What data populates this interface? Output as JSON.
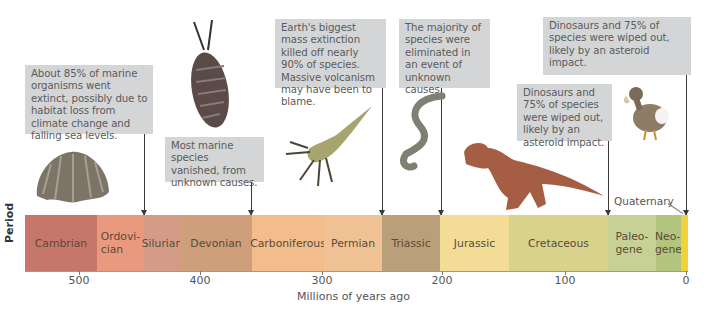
{
  "diagram": {
    "y_axis_label": "Period",
    "x_axis_title": "Millions of years ago",
    "ticks": [
      {
        "label": "500",
        "x": 79
      },
      {
        "label": "400",
        "x": 200
      },
      {
        "label": "300",
        "x": 322
      },
      {
        "label": "200",
        "x": 442
      },
      {
        "label": "100",
        "x": 565
      },
      {
        "label": "0",
        "x": 686
      }
    ],
    "periods": [
      {
        "name": "Cambrian",
        "color": "#c6776a"
      },
      {
        "name": "Ordovi-\ncian",
        "color": "#e99a7e"
      },
      {
        "name": "Silurian",
        "color": "#d49c86"
      },
      {
        "name": "Devonian",
        "color": "#cf9e7a"
      },
      {
        "name": "Carboniferous",
        "color": "#f2bd8b"
      },
      {
        "name": "Permian",
        "color": "#f0c293"
      },
      {
        "name": "Triassic",
        "color": "#b9a07a"
      },
      {
        "name": "Jurassic",
        "color": "#f3dc96"
      },
      {
        "name": "Cretaceous",
        "color": "#d9d28d"
      },
      {
        "name": "Paleo-\ngene",
        "color": "#c7d195"
      },
      {
        "name": "Neo-\ngene",
        "color": "#b3c47c"
      },
      {
        "name": "",
        "color": "#f2d23c"
      }
    ],
    "quaternary_label": "Quaternary",
    "callouts": [
      {
        "id": "end-ordovician",
        "text": "About 85% of marine organisms went extinct, possibly due to habitat loss from climate change and falling sea levels."
      },
      {
        "id": "late-devonian",
        "text": "Most marine species vanished, from unknown causes."
      },
      {
        "id": "end-permian",
        "text": "Earth's biggest mass extinction killed off nearly 90% of species. Massive volcanism may have been to blame."
      },
      {
        "id": "end-triassic",
        "text": "The majority of species were eliminated in an event of unknown causes."
      },
      {
        "id": "end-cretaceous",
        "text": "Dinosaurs and 75% of species were wiped out, likely by an asteroid impact."
      },
      {
        "id": "today",
        "text": "Today, human impacts threaten large animals, specialized organisms, island species, and species harvested by people."
      }
    ],
    "illustrations": [
      "brachiopod",
      "trilobite",
      "eurypterid",
      "conodont",
      "tyrannosaurus",
      "dodo"
    ]
  }
}
